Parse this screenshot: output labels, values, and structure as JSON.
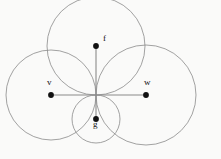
{
  "figure": {
    "canvas": {
      "width": 221,
      "height": 159
    },
    "background_color": "#fafaf9",
    "stroke_color": "#8a8a8a",
    "radius_line_color": "#8a8a8a",
    "point_color": "#111111",
    "label_color": "#111111",
    "common_point": {
      "x": 96,
      "y": 95
    },
    "circles": [
      {
        "name": "circle-v",
        "cx": 51,
        "cy": 95,
        "r": 45
      },
      {
        "name": "circle-w",
        "cx": 146,
        "cy": 95,
        "r": 50
      },
      {
        "name": "circle-f",
        "cx": 96,
        "cy": 46,
        "r": 49
      },
      {
        "name": "circle-g",
        "cx": 96,
        "cy": 119,
        "r": 24
      }
    ],
    "points": [
      {
        "name": "point-f",
        "label": "f",
        "x": 96,
        "y": 46,
        "label_x": 103,
        "label_y": 38
      },
      {
        "name": "point-v",
        "label": "v",
        "x": 51,
        "y": 95,
        "label_x": 47,
        "label_y": 82
      },
      {
        "name": "point-w",
        "label": "w",
        "x": 146,
        "y": 95,
        "label_x": 144,
        "label_y": 82
      },
      {
        "name": "point-g",
        "label": "g",
        "x": 96,
        "y": 119,
        "label_x": 93,
        "label_y": 124
      }
    ],
    "radii_segments": [
      {
        "name": "radius-to-v",
        "x1": 96,
        "y1": 95,
        "x2": 51,
        "y2": 95
      },
      {
        "name": "radius-to-w",
        "x1": 96,
        "y1": 95,
        "x2": 146,
        "y2": 95
      },
      {
        "name": "radius-to-f",
        "x1": 96,
        "y1": 95,
        "x2": 96,
        "y2": 46
      },
      {
        "name": "radius-to-g",
        "x1": 96,
        "y1": 95,
        "x2": 96,
        "y2": 119
      }
    ]
  }
}
